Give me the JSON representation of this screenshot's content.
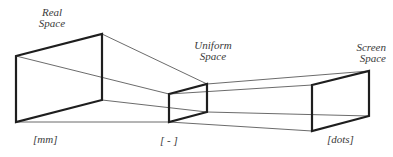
{
  "diagram": {
    "colors": {
      "box_stroke": "#1e1e1e",
      "connector_stroke": "#5a5a5a",
      "text": "#3a3a3a",
      "background": "#ffffff"
    },
    "spaces": [
      {
        "id": "real",
        "title_line1": "Real",
        "title_line2": "Space",
        "unit": "[mm]",
        "box": {
          "tl": [
            16,
            56
          ],
          "tr": [
            102,
            34
          ],
          "br": [
            102,
            100
          ],
          "bl": [
            16,
            122
          ]
        }
      },
      {
        "id": "uniform",
        "title_line1": "Uniform",
        "title_line2": "Space",
        "unit": "[ - ]",
        "box": {
          "tl": [
            169,
            94
          ],
          "tr": [
            207,
            84
          ],
          "br": [
            207,
            112
          ],
          "bl": [
            169,
            122
          ]
        }
      },
      {
        "id": "screen",
        "title_line1": "Screen",
        "title_line2": "Space",
        "unit": "[dots]",
        "box": {
          "tl": [
            312,
            85
          ],
          "tr": [
            369,
            71
          ],
          "br": [
            369,
            116
          ],
          "bl": [
            312,
            131
          ]
        }
      }
    ]
  }
}
